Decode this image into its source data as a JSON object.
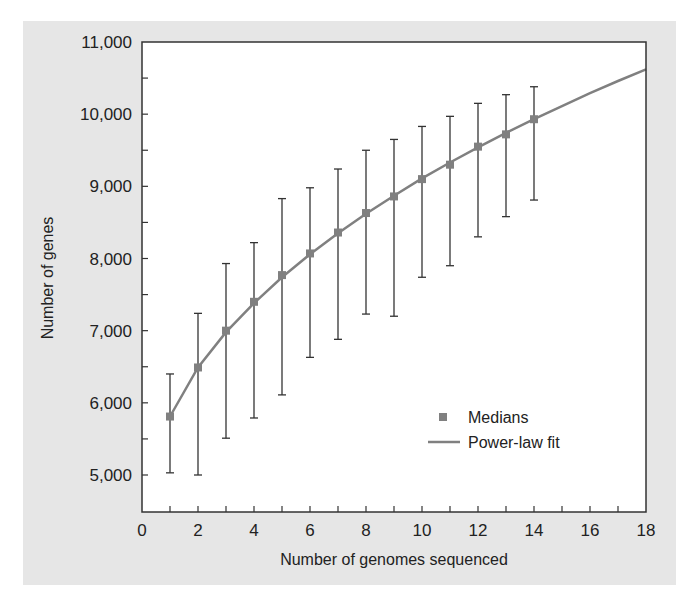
{
  "chart_data": {
    "type": "line",
    "title": "",
    "xlabel": "Number of genomes sequenced",
    "ylabel": "Number of genes",
    "xlim": [
      0,
      18
    ],
    "ylim": [
      4500,
      11000
    ],
    "x_ticks": [
      0,
      2,
      4,
      6,
      8,
      10,
      12,
      14,
      16,
      18
    ],
    "x_tick_labels": [
      "0",
      "2",
      "4",
      "6",
      "8",
      "10",
      "12",
      "14",
      "16",
      "18"
    ],
    "y_ticks": [
      5000,
      6000,
      7000,
      8000,
      9000,
      10000,
      11000
    ],
    "y_tick_labels": [
      "5,000",
      "6,000",
      "7,000",
      "8,000",
      "9,000",
      "10,000",
      "11,000"
    ],
    "grid": false,
    "legend_position": "lower right",
    "series": [
      {
        "name": "Medians",
        "kind": "scatter_with_errorbars",
        "x": [
          1,
          2,
          3,
          4,
          5,
          6,
          7,
          8,
          9,
          10,
          11,
          12,
          13,
          14
        ],
        "values": [
          5810,
          6490,
          7000,
          7400,
          7770,
          8070,
          8360,
          8630,
          8860,
          9100,
          9300,
          9550,
          9720,
          9930
        ],
        "error_upper": [
          6400,
          7240,
          7930,
          8220,
          8830,
          8980,
          9240,
          9500,
          9650,
          9830,
          9970,
          10150,
          10270,
          10380
        ],
        "error_lower": [
          5030,
          5000,
          5510,
          5790,
          6110,
          6630,
          6880,
          7230,
          7200,
          7740,
          7900,
          8300,
          8580,
          8810
        ]
      },
      {
        "name": "Power-law fit",
        "kind": "line",
        "x": [
          1,
          2,
          3,
          4,
          5,
          6,
          7,
          8,
          9,
          10,
          11,
          12,
          13,
          14,
          15,
          16,
          17,
          18
        ],
        "values": [
          5810,
          6490,
          6980,
          7380,
          7740,
          8060,
          8350,
          8620,
          8870,
          9110,
          9330,
          9540,
          9740,
          9930,
          10110,
          10290,
          10460,
          10620
        ]
      }
    ]
  },
  "colors": {
    "panel_bg": "#e6e6e6",
    "plot_bg": "#ffffff",
    "axis": "#333333",
    "series": "#808080"
  }
}
